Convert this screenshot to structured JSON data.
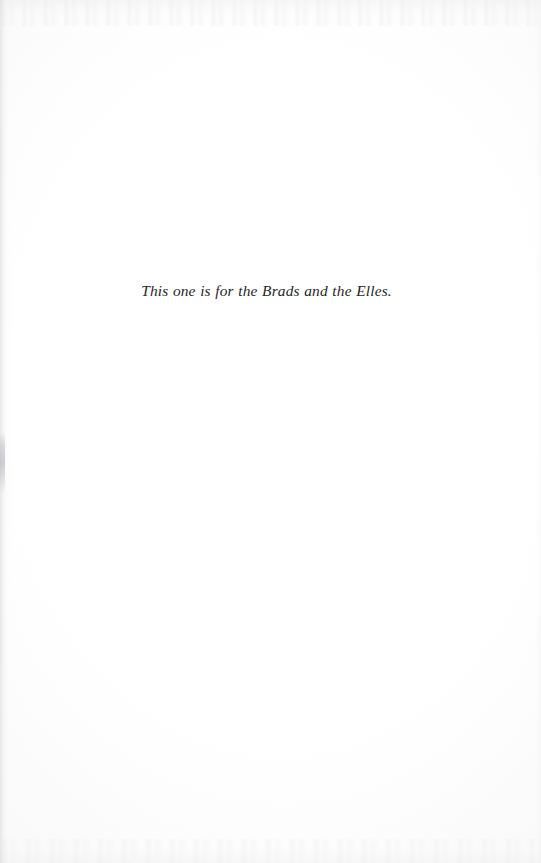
{
  "document": {
    "kind": "book-dedication-page",
    "page_width": 541,
    "page_height": 863,
    "background_color": "#ffffff",
    "text_color": "#262626"
  },
  "dedication": {
    "text": "This one is for the Brads and the Elles."
  },
  "scan_artifacts": {
    "gutter_edge": "left",
    "gutter_tone_color": "#d6d6da",
    "smudge_color": "#b2b2b8",
    "grain_color": "#e6e6e8"
  }
}
